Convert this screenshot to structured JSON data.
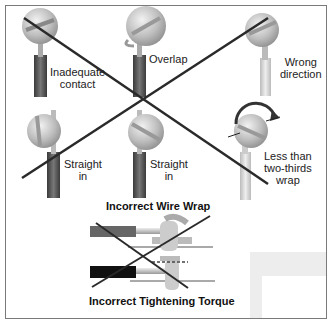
{
  "diagram": {
    "top_section": {
      "crossed_out": true,
      "items": [
        {
          "id": "inadequate-contact",
          "label_line1": "Inadequate",
          "label_line2": "contact"
        },
        {
          "id": "overlap",
          "label_line1": "Overlap",
          "label_line2": ""
        },
        {
          "id": "wrong-direction",
          "label_line1": "Wrong",
          "label_line2": "direction"
        },
        {
          "id": "straight-in-1",
          "label_line1": "Straight",
          "label_line2": "in"
        },
        {
          "id": "straight-in-2",
          "label_line1": "Straight",
          "label_line2": "in"
        },
        {
          "id": "less-than-two-thirds",
          "label_line1": "Less than",
          "label_line2": "two-thirds",
          "label_line3": "wrap"
        }
      ],
      "title": "Incorrect Wire Wrap"
    },
    "bottom_section": {
      "crossed_out": true,
      "title": "Incorrect Tightening Torque"
    },
    "colors": {
      "cross_line": "#2a2a2a",
      "frame": "#7a7a7a",
      "screw": "#c8c8c8",
      "insulation": "#555555"
    }
  }
}
